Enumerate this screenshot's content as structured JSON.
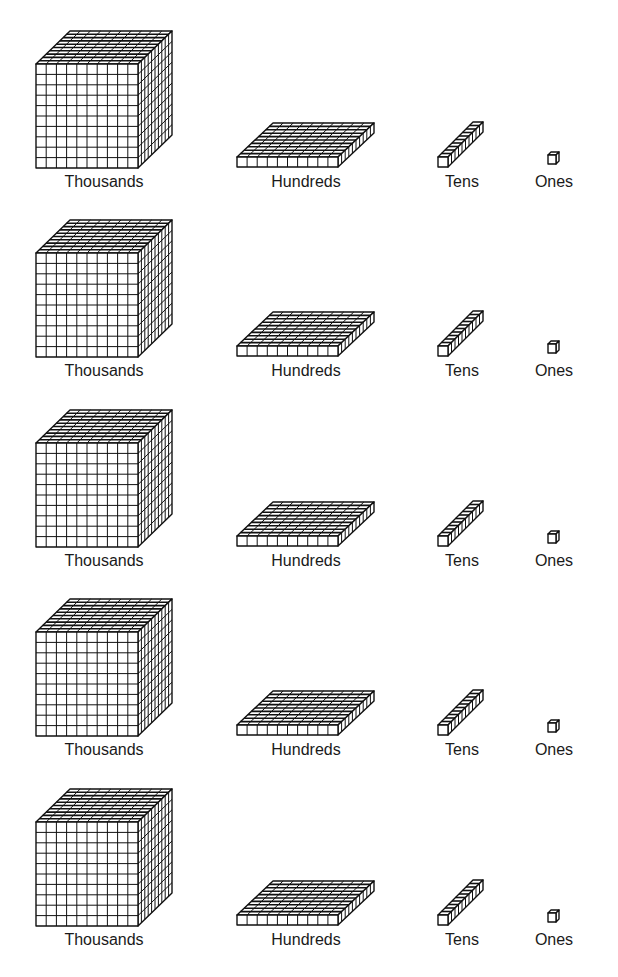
{
  "diagram": {
    "type": "base-ten-blocks",
    "rows": [
      {
        "thousands": {
          "label": "Thousands",
          "units": 1000
        },
        "hundreds": {
          "label": "Hundreds",
          "units": 100
        },
        "tens": {
          "label": "Tens",
          "units": 10
        },
        "ones": {
          "label": "Ones",
          "units": 1
        }
      },
      {
        "thousands": {
          "label": "Thousands",
          "units": 1000
        },
        "hundreds": {
          "label": "Hundreds",
          "units": 100
        },
        "tens": {
          "label": "Tens",
          "units": 10
        },
        "ones": {
          "label": "Ones",
          "units": 1
        }
      },
      {
        "thousands": {
          "label": "Thousands",
          "units": 1000
        },
        "hundreds": {
          "label": "Hundreds",
          "units": 100
        },
        "tens": {
          "label": "Tens",
          "units": 10
        },
        "ones": {
          "label": "Ones",
          "units": 1
        }
      },
      {
        "thousands": {
          "label": "Thousands",
          "units": 1000
        },
        "hundreds": {
          "label": "Hundreds",
          "units": 100
        },
        "tens": {
          "label": "Tens",
          "units": 10
        },
        "ones": {
          "label": "Ones",
          "units": 1
        }
      },
      {
        "thousands": {
          "label": "Thousands",
          "units": 1000
        },
        "hundreds": {
          "label": "Hundreds",
          "units": 100
        },
        "tens": {
          "label": "Tens",
          "units": 10
        },
        "ones": {
          "label": "Ones",
          "units": 1
        }
      }
    ],
    "colors": {
      "stroke": "#111111",
      "fill": "#ffffff",
      "text": "#1a1a1a"
    }
  }
}
